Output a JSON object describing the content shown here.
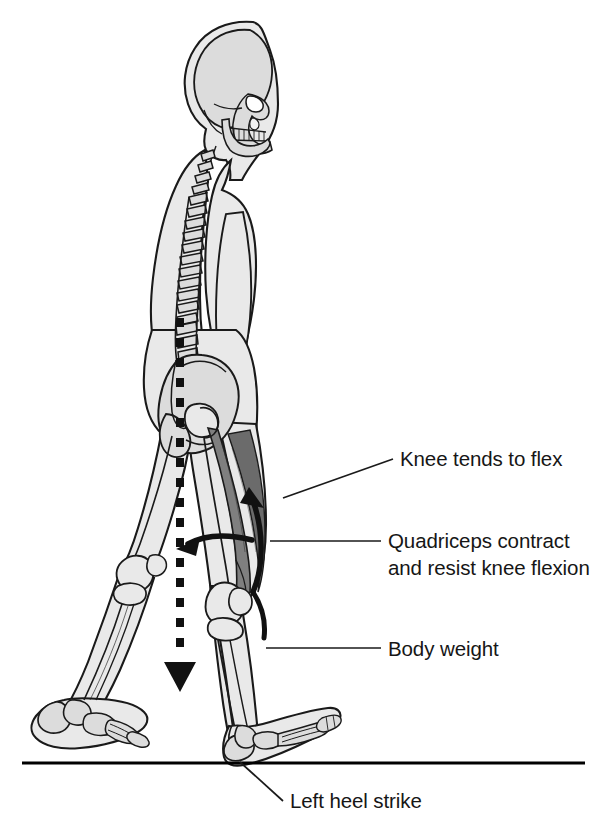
{
  "figure": {
    "type": "anatomical-illustration",
    "view": "right lateral (sagittal) view of walking human skeleton",
    "colors": {
      "outline": "#1a1a1a",
      "body_fill": "#e9e9e9",
      "bone_fill": "#dcdcdc",
      "muscle_fill": "#7f7f7f",
      "muscle_shade": "#6b6b6b",
      "ground_line": "#000000",
      "text": "#161616",
      "background": "#ffffff"
    }
  },
  "labels": {
    "knee_flex": {
      "text": "Knee tends to flex",
      "x": 400,
      "y": 466
    },
    "quadriceps": {
      "line1": "Quadriceps contract",
      "line2": "and resist knee flexion",
      "x": 388,
      "y": 548
    },
    "body_weight": {
      "text": "Body weight",
      "x": 388,
      "y": 656
    },
    "heel_strike": {
      "text": "Left heel strike",
      "x": 290,
      "y": 808
    }
  },
  "annotations": {
    "body_weight_vector": {
      "name": "body-weight-dashed-arrow",
      "style": "vertical dashed line with solid arrowhead pointing down",
      "from_x": 180,
      "from_y": 318,
      "to_x": 180,
      "to_y": 692
    },
    "knee_flexion_arrow": {
      "name": "knee-flexion-curved-arrow",
      "style": "curved arrow pointing down-left at knee joint"
    },
    "quadriceps_arrow": {
      "name": "quadriceps-contraction-curved-arrow",
      "style": "curved arrow pointing up-right along thigh"
    },
    "ground": {
      "name": "ground-line",
      "x1": 22,
      "x2": 585,
      "y": 763
    }
  },
  "anatomy": {
    "skull": "lateral skull with mandible, teeth, orbit and nasal aperture",
    "spine": "cervical, thoracic and lumbar vertebrae with spinous processes",
    "pelvis": "ilium, ischium, acetabulum and femoral head",
    "right_leg": "forward leg at heel strike with flexing knee",
    "left_leg": "trailing leg at toe-off with plantarflexed foot",
    "muscle_highlight": "quadriceps femoris group shaded dark gray"
  }
}
